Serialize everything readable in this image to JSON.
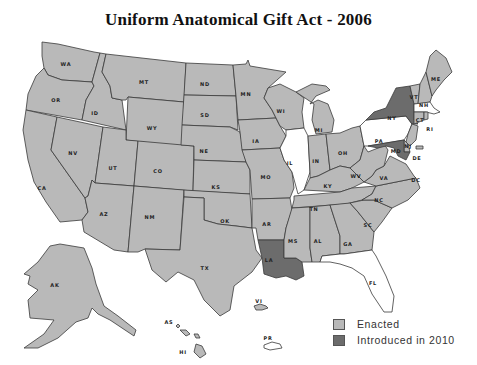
{
  "title": "Uniform Anatomical Gift Act - 2006",
  "colors": {
    "enacted": "#b9b9b9",
    "introduced": "#6c6c6c",
    "not_enacted": "#ffffff",
    "border": "#3a3a3a"
  },
  "legend": {
    "items": [
      {
        "label": "Enacted",
        "color": "#b9b9b9"
      },
      {
        "label": "Introduced in 2010",
        "color": "#6c6c6c"
      }
    ]
  },
  "map": {
    "states": {
      "WA": "enacted",
      "OR": "enacted",
      "CA": "enacted",
      "ID": "enacted",
      "NV": "enacted",
      "MT": "enacted",
      "WY": "enacted",
      "UT": "enacted",
      "AZ": "enacted",
      "CO": "enacted",
      "NM": "enacted",
      "ND": "enacted",
      "SD": "enacted",
      "NE": "enacted",
      "KS": "enacted",
      "OK": "enacted",
      "TX": "enacted",
      "MN": "enacted",
      "IA": "enacted",
      "MO": "enacted",
      "AR": "enacted",
      "LA": "introduced",
      "WI": "enacted",
      "IL": "not_enacted",
      "MI": "enacted",
      "IN": "enacted",
      "OH": "enacted",
      "KY": "enacted",
      "TN": "enacted",
      "MS": "enacted",
      "AL": "enacted",
      "GA": "enacted",
      "FL": "not_enacted",
      "SC": "enacted",
      "NC": "enacted",
      "VA": "enacted",
      "WV": "enacted",
      "PA": "not_enacted",
      "NY": "introduced",
      "VT": "enacted",
      "NH": "enacted",
      "ME": "enacted",
      "MA": "not_enacted",
      "RI": "enacted",
      "CT": "enacted",
      "NJ": "enacted",
      "DE": "enacted",
      "MD": "introduced",
      "DC": "enacted",
      "AK": "enacted",
      "HI": "enacted",
      "AS": "enacted",
      "VI": "enacted",
      "PR": "not_enacted"
    },
    "labels": {
      "WA": "WA",
      "OR": "OR",
      "CA": "CA",
      "ID": "ID",
      "NV": "NV",
      "MT": "MT",
      "WY": "WY",
      "UT": "UT",
      "AZ": "AZ",
      "CO": "CO",
      "NM": "NM",
      "ND": "ND",
      "SD": "SD",
      "NE": "NE",
      "KS": "KS",
      "OK": "OK",
      "TX": "TX",
      "MN": "MN",
      "IA": "IA",
      "MO": "MO",
      "AR": "AR",
      "LA": "LA",
      "WI": "WI",
      "IL": "IL",
      "MI": "MI",
      "IN": "IN",
      "OH": "OH",
      "KY": "KY",
      "TN": "TN",
      "MS": "MS",
      "AL": "AL",
      "GA": "GA",
      "FL": "FL",
      "SC": "SC",
      "NC": "NC",
      "VA": "VA",
      "WV": "WV",
      "PA": "PA",
      "NY": "NY",
      "VT": "VT",
      "NH": "NH",
      "ME": "ME",
      "MA": "MA",
      "RI": "RI",
      "CT": "CT",
      "NJ": "NJ",
      "DE": "DE",
      "MD": "MD",
      "DC": "DC",
      "AK": "AK",
      "HI": "HI",
      "AS": "AS",
      "VI": "VI",
      "PR": "PR"
    }
  }
}
